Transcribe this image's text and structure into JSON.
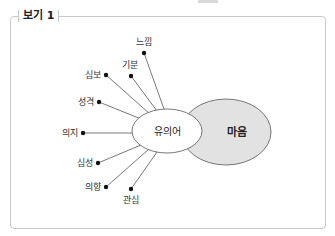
{
  "box": {
    "title": "보기 1"
  },
  "diagram": {
    "center_label": "유의어",
    "main_label": "마음",
    "colors": {
      "main_fill": "#e2e2e2",
      "center_fill": "#ffffff",
      "stroke": "#555555",
      "dot": "#111111"
    },
    "synonyms": [
      {
        "label": "느낌"
      },
      {
        "label": "기분"
      },
      {
        "label": "심보"
      },
      {
        "label": "성격"
      },
      {
        "label": "의지"
      },
      {
        "label": "심성"
      },
      {
        "label": "의향"
      },
      {
        "label": "관심"
      }
    ]
  }
}
